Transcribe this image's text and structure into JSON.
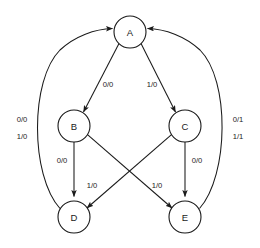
{
  "diagram": {
    "type": "state-transition-diagram",
    "title": "",
    "stroke_color": "#1a1a1a",
    "background_color": "#ffffff",
    "nodes": [
      {
        "id": "A",
        "label": "A",
        "cx": 130,
        "cy": 32,
        "r": 16
      },
      {
        "id": "B",
        "label": "B",
        "cx": 74,
        "cy": 126,
        "r": 16
      },
      {
        "id": "C",
        "label": "C",
        "cx": 185,
        "cy": 126,
        "r": 16
      },
      {
        "id": "D",
        "label": "D",
        "cx": 74,
        "cy": 217,
        "r": 16
      },
      {
        "id": "E",
        "label": "E",
        "cx": 185,
        "cy": 217,
        "r": 16
      }
    ],
    "edges": [
      {
        "id": "a-to-b",
        "from": "A",
        "to": "B",
        "label": "0/0",
        "label_x": 108,
        "label_y": 84
      },
      {
        "id": "a-to-c",
        "from": "A",
        "to": "C",
        "label": "1/0",
        "label_x": 152,
        "label_y": 84
      },
      {
        "id": "b-to-d",
        "from": "B",
        "to": "D",
        "label": "0/0",
        "label_x": 62,
        "label_y": 160
      },
      {
        "id": "c-to-e",
        "from": "C",
        "to": "E",
        "label": "0/0",
        "label_x": 197,
        "label_y": 160
      },
      {
        "id": "c-to-d",
        "from": "C",
        "to": "D",
        "label": "1/0",
        "label_x": 92,
        "label_y": 185
      },
      {
        "id": "b-to-e",
        "from": "B",
        "to": "E",
        "label": "1/0",
        "label_x": 157,
        "label_y": 185
      },
      {
        "id": "d-to-a",
        "from": "D",
        "to": "A",
        "label_line1": "0/0",
        "label_line2": "1/0",
        "label_x": 22,
        "label_y": 126
      },
      {
        "id": "e-to-a",
        "from": "E",
        "to": "A",
        "label_line1": "0/1",
        "label_line2": "1/1",
        "label_x": 238,
        "label_y": 126
      }
    ]
  }
}
